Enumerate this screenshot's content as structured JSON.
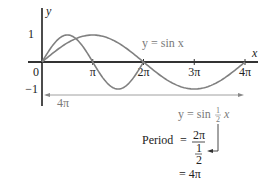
{
  "chart_data": {
    "type": "line",
    "title": "",
    "xlabel": "x",
    "ylabel": "y",
    "xlim": [
      0,
      12.566
    ],
    "ylim": [
      -1,
      1
    ],
    "x_tick_labels": [
      "0",
      "π",
      "2π",
      "3π",
      "4π"
    ],
    "x_tick_values": [
      0,
      3.1416,
      6.2832,
      9.4248,
      12.5664
    ],
    "y_tick_labels": [
      "1",
      "−1"
    ],
    "y_tick_values": [
      1,
      -1
    ],
    "series": [
      {
        "name": "y = sin x",
        "function": "sin(x)",
        "domain": [
          0,
          6.2832
        ],
        "color": "#808080"
      },
      {
        "name": "y = sin ½x",
        "function": "sin(x/2)",
        "domain": [
          0,
          12.5664
        ],
        "color": "#808080"
      }
    ],
    "annotations": {
      "period_arrow_label": "4π",
      "label_sinx": "y = sin x",
      "label_sinhalfx_prefix": "y = sin ",
      "label_sinhalfx_frac_num": "1",
      "label_sinhalfx_frac_den": "2",
      "label_sinhalfx_suffix": "x",
      "period_word": "Period",
      "period_eq": "=",
      "period_num": "2π",
      "period_den_num": "1",
      "period_den_den": "2",
      "period_result": "= 4π"
    },
    "grid": false
  }
}
